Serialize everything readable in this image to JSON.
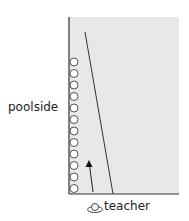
{
  "diagram": {
    "type": "swimming-pool-lane-diagram",
    "colors": {
      "pool_fill": "#e8e8e8",
      "border": "#333333",
      "circle_fill": "#ffffff",
      "circle_stroke": "#444444"
    },
    "labels": {
      "left": "poolside",
      "bottom": "teacher"
    },
    "pool": {
      "x": 69,
      "y": 17,
      "width": 110,
      "height": 177
    },
    "swimmers": {
      "count": 12,
      "x": 74,
      "y_start": 62,
      "y_step": 11.5,
      "radius": 4
    },
    "lane_line": {
      "x1": 85,
      "y1": 32,
      "x2": 113,
      "y2": 194
    },
    "arrow": {
      "x1": 93,
      "y1": 192,
      "x2": 89,
      "y2": 162,
      "direction": "up"
    },
    "teacher_icon": "teacher-top-view-icon"
  }
}
